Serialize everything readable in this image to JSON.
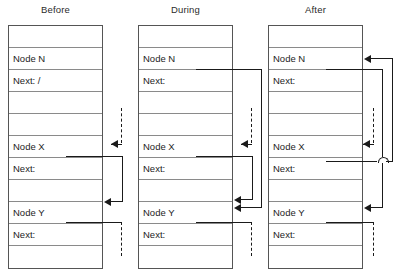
{
  "diagram": {
    "title_alt": "Linked list pointer update: Before, During, After",
    "panels": [
      {
        "id": "before",
        "title": "Before",
        "rows": [
          {
            "label": "",
            "kind": "empty"
          },
          {
            "label": "Node N",
            "kind": "node-header"
          },
          {
            "label": "Next: /",
            "kind": "node-next"
          },
          {
            "label": "",
            "kind": "empty"
          },
          {
            "label": "",
            "kind": "empty"
          },
          {
            "label": "Node X",
            "kind": "node-header"
          },
          {
            "label": "Next:",
            "kind": "node-next"
          },
          {
            "label": "",
            "kind": "empty"
          },
          {
            "label": "Node Y",
            "kind": "node-header"
          },
          {
            "label": "Next:",
            "kind": "node-next"
          },
          {
            "label": "",
            "kind": "empty"
          }
        ],
        "pointers": [
          {
            "name": "incoming-dashed-to-node-x",
            "style": "dashed",
            "from": "above",
            "to": "Node X"
          },
          {
            "name": "node-x-next-to-node-y",
            "style": "solid",
            "from": "Node X Next",
            "to": "Node Y"
          },
          {
            "name": "node-y-next-dashed-below",
            "style": "dashed",
            "from": "Node Y Next",
            "to": "below"
          }
        ]
      },
      {
        "id": "during",
        "title": "During",
        "rows": [
          {
            "label": "",
            "kind": "empty"
          },
          {
            "label": "Node N",
            "kind": "node-header"
          },
          {
            "label": "Next:",
            "kind": "node-next"
          },
          {
            "label": "",
            "kind": "empty"
          },
          {
            "label": "",
            "kind": "empty"
          },
          {
            "label": "Node X",
            "kind": "node-header"
          },
          {
            "label": "Next:",
            "kind": "node-next"
          },
          {
            "label": "",
            "kind": "empty"
          },
          {
            "label": "Node Y",
            "kind": "node-header"
          },
          {
            "label": "Next:",
            "kind": "node-next"
          },
          {
            "label": "",
            "kind": "empty"
          }
        ],
        "pointers": [
          {
            "name": "node-n-next-to-node-y",
            "style": "solid",
            "from": "Node N Next",
            "to": "Node Y"
          },
          {
            "name": "incoming-dashed-to-node-x",
            "style": "dashed",
            "from": "above",
            "to": "Node X"
          },
          {
            "name": "node-x-next-to-node-y",
            "style": "solid",
            "from": "Node X Next",
            "to": "Node Y"
          },
          {
            "name": "node-y-next-dashed-below",
            "style": "dashed",
            "from": "Node Y Next",
            "to": "below"
          }
        ]
      },
      {
        "id": "after",
        "title": "After",
        "rows": [
          {
            "label": "",
            "kind": "empty"
          },
          {
            "label": "Node N",
            "kind": "node-header"
          },
          {
            "label": "Next:",
            "kind": "node-next"
          },
          {
            "label": "",
            "kind": "empty"
          },
          {
            "label": "",
            "kind": "empty"
          },
          {
            "label": "Node X",
            "kind": "node-header"
          },
          {
            "label": "Next:",
            "kind": "node-next"
          },
          {
            "label": "",
            "kind": "empty"
          },
          {
            "label": "Node Y",
            "kind": "node-header"
          },
          {
            "label": "Next:",
            "kind": "node-next"
          },
          {
            "label": "",
            "kind": "empty"
          }
        ],
        "pointers": [
          {
            "name": "node-n-next-to-node-y",
            "style": "solid",
            "from": "Node N Next",
            "to": "Node Y"
          },
          {
            "name": "incoming-dashed-to-node-x",
            "style": "dashed",
            "from": "above",
            "to": "Node X"
          },
          {
            "name": "node-x-next-to-node-n",
            "style": "solid",
            "from": "Node X Next",
            "to": "Node N"
          },
          {
            "name": "node-y-next-dashed-below",
            "style": "dashed",
            "from": "Node Y Next",
            "to": "below"
          }
        ]
      }
    ],
    "colors": {
      "line": "#1a1a1a",
      "table_border": "#555555",
      "row_divider": "#8a8a8a",
      "text": "#1d1d1d",
      "background": "#ffffff"
    }
  }
}
